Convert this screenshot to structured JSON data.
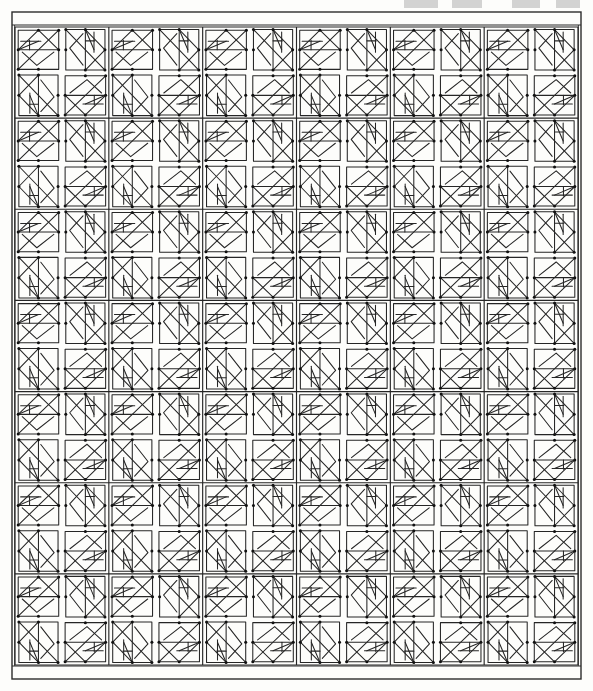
{
  "document": {
    "kind": "line-drawing",
    "title": "Pinwheel Quilt Block Pattern Chart",
    "description": "Monochrome line-art grid of repeating pinwheel quilt blocks drawn with thin black strokes on white paper.",
    "background_color": "#fdfdfb",
    "ink_color": "#1a1a1a",
    "paper_tint": "#f7f7f5"
  },
  "canvas": {
    "width": 593,
    "height": 691
  },
  "frame": {
    "x": 12,
    "y": 12,
    "width": 569,
    "height": 667,
    "stroke": "#2b2b2b",
    "stroke_width": 1.4,
    "top_band_height": 13,
    "bottom_band_height": 13,
    "inner_inset": 2
  },
  "grid": {
    "block_columns": 6,
    "block_rows": 7,
    "quadrants_per_block_x": 2,
    "quadrants_per_block_y": 2,
    "quadrant_columns": 12,
    "quadrant_rows": 14,
    "area": {
      "x": 15,
      "y": 27,
      "width": 563,
      "height": 638
    },
    "sashing_color": "#ffffff",
    "line_color": "#262626",
    "line_width": 1.05,
    "cell_inset": 3.2
  },
  "motif": {
    "name": "pinwheel-arrow-triangle",
    "rotation_sequence_deg": [
      0,
      90,
      270,
      180
    ],
    "strokes": [
      "cell-outline",
      "main-diagonal",
      "upper-triangle",
      "inner-nested-triangle",
      "short-stem",
      "half-bar"
    ],
    "vertex_dot_radius": 1.5,
    "vertex_dot_color": "#111111"
  },
  "bleed_marks": [
    {
      "x": 404,
      "y": 0,
      "width": 34
    },
    {
      "x": 452,
      "y": 0,
      "width": 30
    },
    {
      "x": 512,
      "y": 0,
      "width": 28
    },
    {
      "x": 556,
      "y": 0,
      "width": 24
    }
  ],
  "legend": {
    "has_text": false,
    "has_axes": false,
    "has_labels": false,
    "note": "Diagram contains no printed text, numbers, axis ticks or legend."
  }
}
